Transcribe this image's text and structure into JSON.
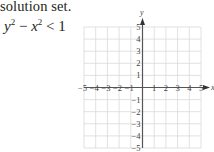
{
  "text": {
    "intro": "solution set.",
    "inequality": {
      "y_base": "y",
      "y_exp": "2",
      "minus": " − ",
      "x_base": "x",
      "x_exp": "2",
      "rel": " < ",
      "rhs": "1"
    }
  },
  "graph": {
    "x_axis_label": "x",
    "y_axis_label": "y",
    "x_ticks": [
      "−5",
      "−4",
      "−3",
      "−2",
      "−1",
      "1",
      "2",
      "3",
      "4",
      "5"
    ],
    "y_ticks": [
      "5",
      "4",
      "3",
      "2",
      "1",
      "−1",
      "−2",
      "−3",
      "−4",
      "−5"
    ],
    "range": {
      "x": [
        -5,
        5
      ],
      "y": [
        -5,
        5
      ]
    },
    "grid": true,
    "grid_color": "#d9d9d9",
    "axis_color": "#555555"
  }
}
